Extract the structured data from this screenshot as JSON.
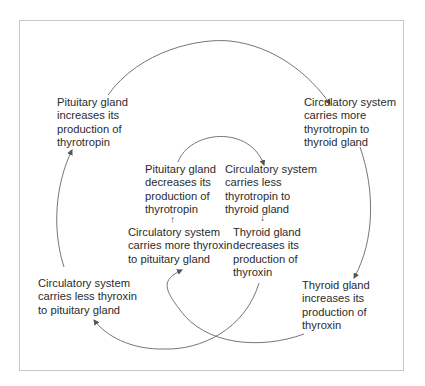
{
  "diagram": {
    "type": "feedback-cycle",
    "outer_cycle": {
      "nodes": [
        {
          "id": "pituitary-increases",
          "label": "Pituitary gland\nincreases its\nproduction of\nthyrotropin"
        },
        {
          "id": "circ-more-thyrotropin",
          "label": "Circulatory system\ncarries more\nthyrotropin to\nthyroid gland"
        },
        {
          "id": "thyroid-increases",
          "label": "Thyroid gland\nincreases its\nproduction of\nthyroxin"
        },
        {
          "id": "circ-less-thyroxin",
          "label": "Circulatory system\ncarries less thyroxin\nto pituitary gland"
        }
      ]
    },
    "inner_cycle": {
      "nodes": [
        {
          "id": "pituitary-decreases",
          "label": "Pituitary gland\ndecreases its\nproduction of\nthyrotropin"
        },
        {
          "id": "circ-less-thyrotropin",
          "label": "Circulatory system\ncarries less\nthyrotropin to\nthyroid gland"
        },
        {
          "id": "thyroid-decreases",
          "label": "Thyroid gland\ndecreases its\nproduction of\nthyroxin"
        },
        {
          "id": "circ-more-thyroxin",
          "label": "Circulatory system\ncarries more thyroxin\nto pituitary gland"
        }
      ]
    },
    "edges": [
      {
        "from": "pituitary-increases",
        "to": "circ-more-thyrotropin"
      },
      {
        "from": "circ-more-thyrotropin",
        "to": "thyroid-increases"
      },
      {
        "from": "thyroid-increases",
        "to": "circ-more-thyroxin"
      },
      {
        "from": "circ-more-thyroxin",
        "to": "pituitary-decreases"
      },
      {
        "from": "pituitary-decreases",
        "to": "circ-less-thyrotropin"
      },
      {
        "from": "circ-less-thyrotropin",
        "to": "thyroid-decreases"
      },
      {
        "from": "thyroid-decreases",
        "to": "circ-less-thyroxin"
      },
      {
        "from": "circ-less-thyroxin",
        "to": "pituitary-increases"
      }
    ],
    "small_arrows": {
      "up": "↑",
      "down": "↓"
    },
    "colors": {
      "line": "#555555",
      "text": "#2b2b2b",
      "frame": "#c8c8c8"
    }
  }
}
